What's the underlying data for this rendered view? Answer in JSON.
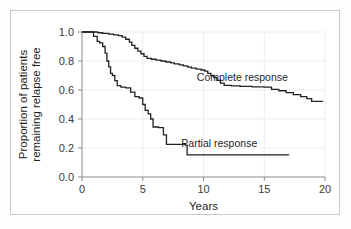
{
  "figure": {
    "background_color": "#ffffff",
    "border_color": "#c9c9c9"
  },
  "chart_data": {
    "type": "line",
    "title": "",
    "subtitle": "",
    "xlabel": "Years",
    "ylabel": "Proportion of patients remaining relapse free",
    "ylabel_line1": "Proportion of patients",
    "ylabel_line2": "remaining relapse free",
    "xlim": [
      0,
      20
    ],
    "ylim": [
      0,
      1.0
    ],
    "xticks": [
      0,
      5,
      10,
      15,
      20
    ],
    "xtick_labels": [
      "0",
      "5",
      "10",
      "15",
      "20"
    ],
    "yticks": [
      0.0,
      0.2,
      0.4,
      0.6,
      0.8,
      1.0
    ],
    "ytick_labels": [
      "0.0",
      "0.2",
      "0.4",
      "0.6",
      "0.8",
      "1.0"
    ],
    "grid": true,
    "grid_color": "#e8e8e8",
    "legend": "inline-annotations",
    "line_color": "#222222",
    "step_style": "post",
    "annotations": [
      {
        "text": "Complete response",
        "x": 13.2,
        "y": 0.665,
        "series": "Complete response"
      },
      {
        "text": "Partial response",
        "x": 11.3,
        "y": 0.21,
        "series": "Partial response"
      }
    ],
    "series": [
      {
        "name": "Complete response",
        "points": [
          [
            0.0,
            1.0
          ],
          [
            1.0,
            1.0
          ],
          [
            1.3,
            0.995
          ],
          [
            1.7,
            0.99
          ],
          [
            2.2,
            0.985
          ],
          [
            2.6,
            0.98
          ],
          [
            3.0,
            0.975
          ],
          [
            3.3,
            0.965
          ],
          [
            3.6,
            0.95
          ],
          [
            3.9,
            0.93
          ],
          [
            4.1,
            0.908
          ],
          [
            4.35,
            0.888
          ],
          [
            4.6,
            0.868
          ],
          [
            4.85,
            0.85
          ],
          [
            5.1,
            0.832
          ],
          [
            5.35,
            0.818
          ],
          [
            5.7,
            0.812
          ],
          [
            6.1,
            0.806
          ],
          [
            6.5,
            0.8
          ],
          [
            6.9,
            0.793
          ],
          [
            7.3,
            0.787
          ],
          [
            7.6,
            0.78
          ],
          [
            8.0,
            0.773
          ],
          [
            8.35,
            0.766
          ],
          [
            8.7,
            0.758
          ],
          [
            9.0,
            0.751
          ],
          [
            9.4,
            0.744
          ],
          [
            9.8,
            0.738
          ],
          [
            10.1,
            0.73
          ],
          [
            10.35,
            0.715
          ],
          [
            10.6,
            0.7
          ],
          [
            10.85,
            0.685
          ],
          [
            11.1,
            0.667
          ],
          [
            11.4,
            0.648
          ],
          [
            11.7,
            0.632
          ],
          [
            12.3,
            0.628
          ],
          [
            13.0,
            0.625
          ],
          [
            14.0,
            0.622
          ],
          [
            15.0,
            0.62
          ],
          [
            15.6,
            0.605
          ],
          [
            16.2,
            0.595
          ],
          [
            16.8,
            0.582
          ],
          [
            17.4,
            0.568
          ],
          [
            18.0,
            0.555
          ],
          [
            18.5,
            0.54
          ],
          [
            18.9,
            0.522
          ],
          [
            19.8,
            0.52
          ]
        ]
      },
      {
        "name": "Partial response",
        "points": [
          [
            0.0,
            1.0
          ],
          [
            0.7,
            1.0
          ],
          [
            0.95,
            0.97
          ],
          [
            1.25,
            0.935
          ],
          [
            1.45,
            0.925
          ],
          [
            1.7,
            0.9
          ],
          [
            1.9,
            0.855
          ],
          [
            2.05,
            0.8
          ],
          [
            2.2,
            0.76
          ],
          [
            2.35,
            0.715
          ],
          [
            2.5,
            0.7
          ],
          [
            2.7,
            0.665
          ],
          [
            2.9,
            0.63
          ],
          [
            3.2,
            0.62
          ],
          [
            3.6,
            0.615
          ],
          [
            4.0,
            0.585
          ],
          [
            4.35,
            0.555
          ],
          [
            4.7,
            0.545
          ],
          [
            5.0,
            0.5
          ],
          [
            5.2,
            0.46
          ],
          [
            5.45,
            0.435
          ],
          [
            5.65,
            0.4
          ],
          [
            5.85,
            0.345
          ],
          [
            6.3,
            0.34
          ],
          [
            6.7,
            0.29
          ],
          [
            6.95,
            0.225
          ],
          [
            8.5,
            0.22
          ],
          [
            8.65,
            0.152
          ],
          [
            17.0,
            0.15
          ]
        ]
      }
    ]
  }
}
